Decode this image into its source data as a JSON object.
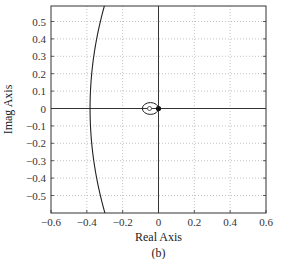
{
  "chart_data": {
    "type": "line",
    "title": "",
    "caption": "(b)",
    "xlabel": "Real Axis",
    "ylabel": "Imag Axis",
    "xlim": [
      -0.6,
      0.6
    ],
    "ylim": [
      -0.59,
      0.59
    ],
    "grid": true,
    "x_ticks": [
      -0.6,
      -0.4,
      -0.2,
      0,
      0.2,
      0.4,
      0.6
    ],
    "x_tick_labels": [
      "-0.6",
      "-0.4",
      "-0.2",
      "0",
      "0.2",
      "0.4",
      "0.6"
    ],
    "y_ticks": [
      0.5,
      0.4,
      0.3,
      0.2,
      0.1,
      0,
      -0.1,
      -0.2,
      -0.3,
      -0.4,
      -0.5
    ],
    "y_tick_labels": [
      "0.5",
      "0.4",
      "0.3",
      "0.2",
      "0.1",
      "0",
      "-0.1",
      "-0.2",
      "-0.3",
      "-0.4",
      "-0.5"
    ],
    "series": [
      {
        "name": "large-arc",
        "description": "Large arc crossing real axis near -0.38",
        "points": [
          [
            -0.3,
            0.59
          ],
          [
            -0.34,
            0.4
          ],
          [
            -0.37,
            0.2
          ],
          [
            -0.38,
            0
          ],
          [
            -0.37,
            -0.2
          ],
          [
            -0.34,
            -0.4
          ],
          [
            -0.3,
            -0.59
          ]
        ]
      },
      {
        "name": "small-loop",
        "description": "Small closed loop around -0.05",
        "points": [
          [
            0,
            0
          ],
          [
            -0.03,
            0.03
          ],
          [
            -0.07,
            0.03
          ],
          [
            -0.09,
            0
          ],
          [
            -0.07,
            -0.03
          ],
          [
            -0.03,
            -0.03
          ],
          [
            0,
            0
          ]
        ]
      }
    ],
    "markers": [
      {
        "type": "open-circle",
        "x": -0.05,
        "y": 0
      },
      {
        "type": "filled-dot",
        "x": 0,
        "y": 0
      }
    ]
  }
}
